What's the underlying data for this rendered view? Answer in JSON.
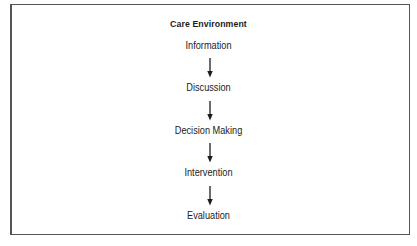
{
  "diagram": {
    "title": "Care Environment",
    "steps": [
      {
        "label": "Information"
      },
      {
        "label": "Discussion"
      },
      {
        "label": "Decision Making"
      },
      {
        "label": "Intervention"
      },
      {
        "label": "Evaluation"
      }
    ],
    "colors": {
      "text": "#1c1c1c",
      "border": "#555555",
      "background": "#ffffff"
    }
  }
}
